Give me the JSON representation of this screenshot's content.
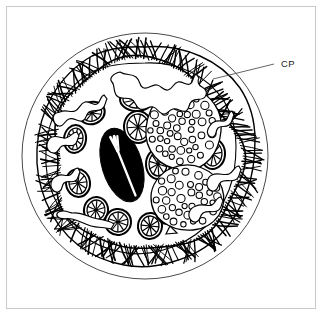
{
  "figure": {
    "background_color": "#ffffff",
    "frame_color": "#c9c9c9",
    "ink_color": "#000000",
    "width": 323,
    "height": 316
  },
  "labels": [
    {
      "id": "cp",
      "text": "CP",
      "meaning": "ciliary-pellicle",
      "x": 281,
      "y": 67,
      "leader": {
        "x1": 274,
        "y1": 64,
        "x2": 213,
        "y2": 79
      }
    }
  ],
  "outer_circle": {
    "name": "cell-outline-circle",
    "cx": 145,
    "cy": 156,
    "r": 123,
    "stroke": "#3a3a3a",
    "stroke_width": 1
  },
  "cilia_band": {
    "name": "cilia-band",
    "count": 230,
    "inner_radius": 94,
    "outer_radius": 112,
    "color": "#000000",
    "description": "dense hair-like ciliary fringe around the cell periphery"
  },
  "body_outline": {
    "name": "cell-body-outline",
    "description": "scalloped, lobed cytoplasm boundary just inside the cilia"
  },
  "nucleus": {
    "name": "macronucleus",
    "cx": 122,
    "cy": 165,
    "rx": 20,
    "ry": 38,
    "rotation": -17,
    "fill": "#000000",
    "slit": "white longitudinal cleft with a small fork at the top"
  },
  "mitochondria": {
    "name": "mitochondrion",
    "label": "Mitochondrion",
    "spokes": 10,
    "count": 13,
    "items": [
      {
        "cx": 92,
        "cy": 113,
        "rx": 13,
        "ry": 11,
        "rot": -22
      },
      {
        "cx": 136,
        "cy": 100,
        "rx": 16,
        "ry": 11,
        "rot": 4
      },
      {
        "cx": 75,
        "cy": 139,
        "rx": 11,
        "ry": 14,
        "rot": 8
      },
      {
        "cx": 138,
        "cy": 127,
        "rx": 14,
        "ry": 16,
        "rot": -4
      },
      {
        "cx": 158,
        "cy": 164,
        "rx": 12,
        "ry": 15,
        "rot": 0
      },
      {
        "cx": 213,
        "cy": 154,
        "rx": 12,
        "ry": 15,
        "rot": 4
      },
      {
        "cx": 78,
        "cy": 183,
        "rx": 12,
        "ry": 14,
        "rot": -8
      },
      {
        "cx": 96,
        "cy": 210,
        "rx": 12,
        "ry": 13,
        "rot": 10
      },
      {
        "cx": 118,
        "cy": 222,
        "rx": 13,
        "ry": 13,
        "rot": -6
      },
      {
        "cx": 150,
        "cy": 226,
        "rx": 12,
        "ry": 13,
        "rot": 6
      },
      {
        "cx": 167,
        "cy": 212,
        "rx": 11,
        "ry": 12,
        "rot": -12
      },
      {
        "cx": 114,
        "cy": 173,
        "rx": 0,
        "ry": 0,
        "rot": 0
      },
      {
        "cx": 0,
        "cy": 0,
        "rx": 0,
        "ry": 0,
        "rot": 0
      }
    ]
  },
  "food_vacuoles": [
    {
      "name": "food-vacuole-upper",
      "label": "Food vacuole",
      "cx": 182,
      "cy": 128,
      "granule_count": 46,
      "description": "irregular rounded vacuole packed with small circular granules"
    },
    {
      "name": "food-vacuole-lower",
      "label": "Food vacuole",
      "cx": 187,
      "cy": 197,
      "granule_count": 36,
      "description": "irregular rounded vacuole packed with small circular granules"
    }
  ],
  "cytoplasmic_channels": {
    "name": "cytoplasmic-channel",
    "label": "Cytoplasmic channel",
    "count": 8,
    "description": "meandering thin-walled tubular channels threading through the cytoplasm"
  },
  "small_bodies": [
    {
      "name": "small-triangular-body",
      "cx": 171,
      "cy": 230
    }
  ]
}
